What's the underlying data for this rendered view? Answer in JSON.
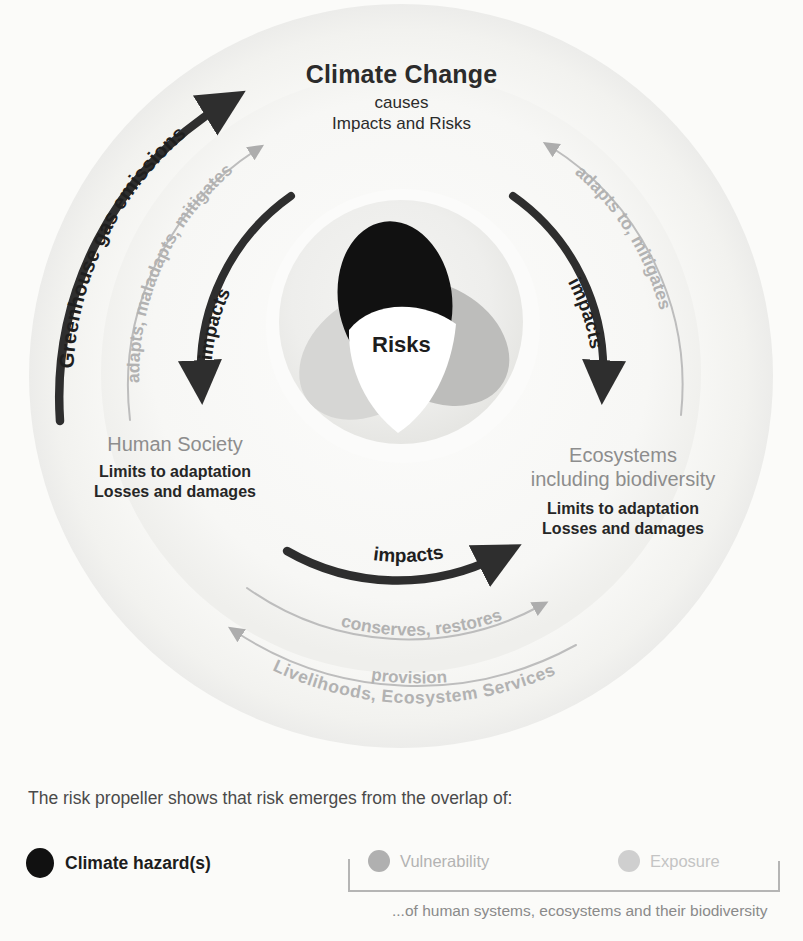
{
  "diagram": {
    "title": "Climate Change",
    "subtitle_line1": "causes",
    "subtitle_line2": "Impacts and Risks",
    "center_label": "Risks",
    "human_society": {
      "heading": "Human Society",
      "detail_line1": "Limits to adaptation",
      "detail_line2": "Losses and damages"
    },
    "ecosystems": {
      "heading_line1": "Ecosystems",
      "heading_line2": "including biodiversity",
      "detail_line1": "Limits to adaptation",
      "detail_line2": "Losses and damages"
    },
    "arrows": {
      "left_outer": "Greenhouse gas emissions",
      "left_middle": "adapts, maladapts, mitigates",
      "left_inner": "impacts",
      "right_inner": "impacts",
      "right_outer": "adapts to, mitigates",
      "bottom_inner": "impacts",
      "bottom_middle": "conserves, restores",
      "bottom_outer_upper": "provision",
      "bottom_outer_lower": "Livelihoods, Ecosystem Services"
    }
  },
  "legend": {
    "intro": "The risk propeller shows that risk emerges from the overlap of:",
    "items": [
      {
        "label": "Climate hazard(s)",
        "color": "#111111"
      },
      {
        "label": "Vulnerability",
        "color": "#b0b0b0"
      },
      {
        "label": "Exposure",
        "color": "#cfcfcf"
      }
    ],
    "footnote": "...of human systems, ecosystems and their biodiversity"
  },
  "colors": {
    "hazard": "#111111",
    "vulnerability": "#d2d2d2",
    "exposure": "#b9b9b9",
    "risk_center": "#ffffff",
    "arrow_dark": "#2e2e2e",
    "arrow_light": "#b6b6b6",
    "heading_gray": "#8d8d8d",
    "background": "#fbfbf9"
  }
}
